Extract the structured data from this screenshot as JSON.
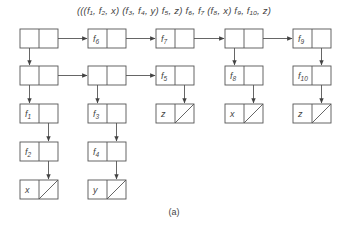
{
  "diagram": {
    "expression": "(((f₁, f₂, x) (f₃, f₄, y) f₅, z) f₆, f₇ (f₈, x) f₉, f₁₀, z)",
    "caption": "(a)",
    "stroke_color": "#555555",
    "nodes": [
      {
        "id": "n1",
        "x": 20,
        "y": 29,
        "car": "",
        "car_ptr": true,
        "cdr": "ptr"
      },
      {
        "id": "n2",
        "x": 88,
        "y": 29,
        "car": "f6",
        "car_label": "f",
        "car_sub": "6",
        "cdr": "ptr"
      },
      {
        "id": "n3",
        "x": 156,
        "y": 29,
        "car_label": "f",
        "car_sub": "7",
        "cdr": "ptr"
      },
      {
        "id": "n4",
        "x": 225,
        "y": 29,
        "car": "",
        "car_ptr": true,
        "cdr": "ptr"
      },
      {
        "id": "n5",
        "x": 293,
        "y": 29,
        "car_label": "f",
        "car_sub": "9",
        "cdr": "down"
      },
      {
        "id": "n6",
        "x": 20,
        "y": 66,
        "car": "",
        "car_ptr": true,
        "cdr": "ptr"
      },
      {
        "id": "n7",
        "x": 88,
        "y": 66,
        "car": "",
        "car_ptr": true,
        "cdr": "ptr"
      },
      {
        "id": "n8",
        "x": 156,
        "y": 66,
        "car_label": "f",
        "car_sub": "5",
        "cdr": "down"
      },
      {
        "id": "n9",
        "x": 225,
        "y": 66,
        "car_label": "f",
        "car_sub": "8",
        "cdr": "down"
      },
      {
        "id": "n10",
        "x": 293,
        "y": 66,
        "car_label": "f",
        "car_sub": "10",
        "cdr": "down"
      },
      {
        "id": "n11",
        "x": 20,
        "y": 104,
        "car_label": "f",
        "car_sub": "1",
        "cdr": "down"
      },
      {
        "id": "n12",
        "x": 88,
        "y": 104,
        "car_label": "f",
        "car_sub": "3",
        "cdr": "down"
      },
      {
        "id": "n13",
        "x": 156,
        "y": 104,
        "car_label": "z",
        "cdr": "nil"
      },
      {
        "id": "n14",
        "x": 225,
        "y": 104,
        "car_label": "x",
        "cdr": "nil"
      },
      {
        "id": "n15",
        "x": 293,
        "y": 104,
        "car_label": "z",
        "cdr": "nil"
      },
      {
        "id": "n16",
        "x": 20,
        "y": 142,
        "car_label": "f",
        "car_sub": "2",
        "cdr": "down"
      },
      {
        "id": "n17",
        "x": 88,
        "y": 142,
        "car_label": "f",
        "car_sub": "4",
        "cdr": "down"
      },
      {
        "id": "n18",
        "x": 20,
        "y": 180,
        "car_label": "x",
        "cdr": "nil"
      },
      {
        "id": "n19",
        "x": 88,
        "y": 180,
        "car_label": "y",
        "cdr": "nil"
      }
    ]
  }
}
